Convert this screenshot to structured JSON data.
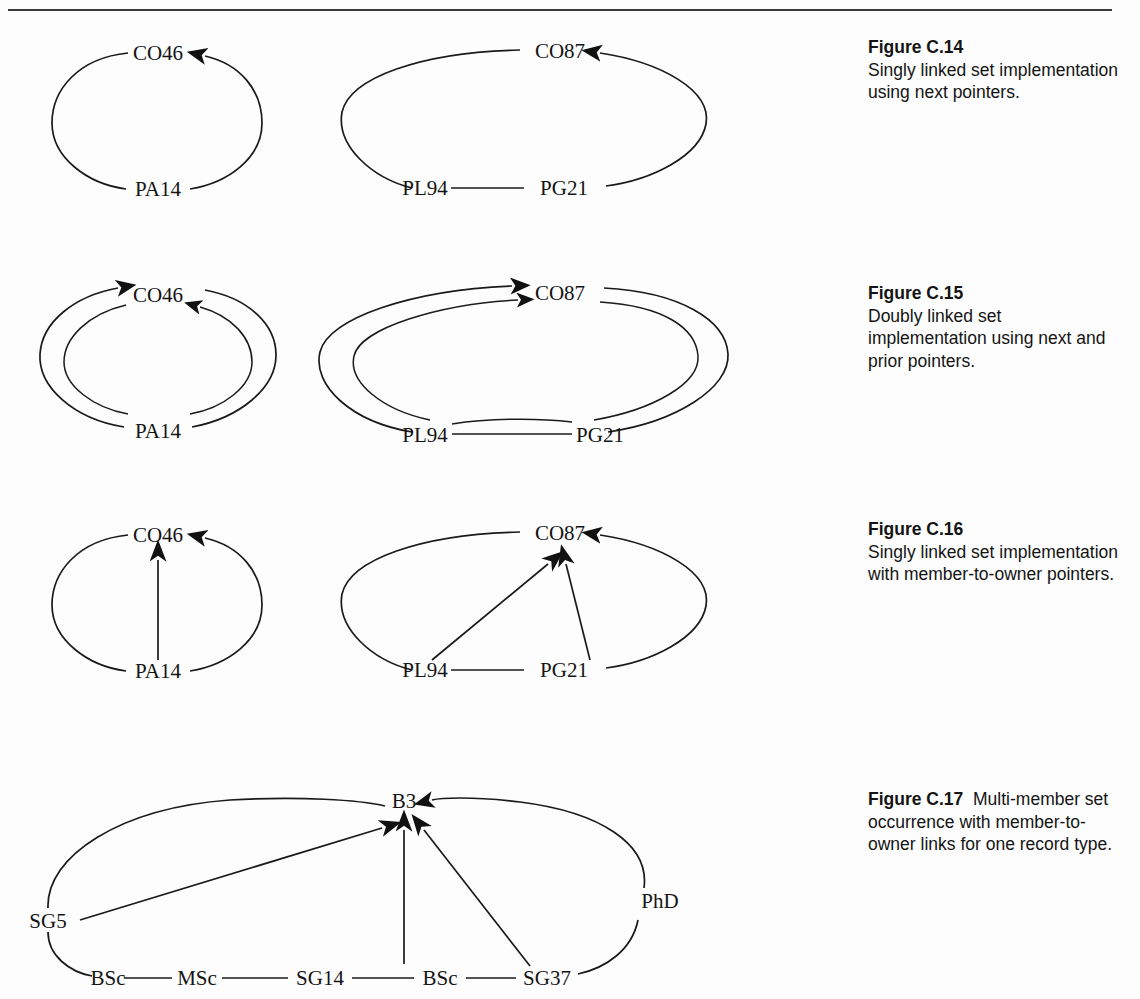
{
  "page": {
    "background": "#fdfdfd",
    "ink": "#141414",
    "rule_color": "#3a3a3a"
  },
  "figures": [
    {
      "id": "c14",
      "caption_lead": "Figure C.14",
      "caption_body": "Singly linked set implementation using next pointers.",
      "diagrams": [
        {
          "id": "c14-left",
          "kind": "singly-linked-ring",
          "owner": "CO46",
          "members": [
            "PA14"
          ],
          "nodes": [
            "CO46",
            "PA14"
          ]
        },
        {
          "id": "c14-right",
          "kind": "singly-linked-ring",
          "owner": "CO87",
          "members": [
            "PL94",
            "PG21"
          ],
          "nodes": [
            "CO87",
            "PL94",
            "PG21"
          ]
        }
      ]
    },
    {
      "id": "c15",
      "caption_lead": "Figure C.15",
      "caption_body": "Doubly linked set implementation using next and prior pointers.",
      "diagrams": [
        {
          "id": "c15-left",
          "kind": "doubly-linked-ring",
          "owner": "CO46",
          "members": [
            "PA14"
          ],
          "nodes": [
            "CO46",
            "PA14"
          ]
        },
        {
          "id": "c15-right",
          "kind": "doubly-linked-ring",
          "owner": "CO87",
          "members": [
            "PL94",
            "PG21"
          ],
          "nodes": [
            "CO87",
            "PL94",
            "PG21"
          ]
        }
      ]
    },
    {
      "id": "c16",
      "caption_lead": "Figure C.16",
      "caption_body": "Singly linked set implementation with member-to-owner pointers.",
      "diagrams": [
        {
          "id": "c16-left",
          "kind": "singly-linked-ring-with-owner-pointers",
          "owner": "CO46",
          "members": [
            "PA14"
          ],
          "nodes": [
            "CO46",
            "PA14"
          ]
        },
        {
          "id": "c16-right",
          "kind": "singly-linked-ring-with-owner-pointers",
          "owner": "CO87",
          "members": [
            "PL94",
            "PG21"
          ],
          "nodes": [
            "CO87",
            "PL94",
            "PG21"
          ]
        }
      ]
    },
    {
      "id": "c17",
      "caption_lead": "Figure C.17",
      "caption_body": "Multi-member set occurrence with member-to-owner links for one record type.",
      "caption_inline": true,
      "diagrams": [
        {
          "id": "c17-main",
          "kind": "multi-member-set-occurrence",
          "owner": "B3",
          "members": [
            "SG5",
            "BSc",
            "MSc",
            "SG14",
            "BSc",
            "SG37",
            "PhD"
          ],
          "owner_pointer_sources": [
            "SG5",
            "SG14",
            "SG37"
          ],
          "nodes": [
            "B3",
            "SG5",
            "BSc",
            "MSc",
            "SG14",
            "BSc",
            "SG37",
            "PhD"
          ]
        }
      ]
    }
  ],
  "labels": {
    "c14_left": {
      "owner": "CO46",
      "m1": "PA14"
    },
    "c14_right": {
      "owner": "CO87",
      "m1": "PL94",
      "m2": "PG21"
    },
    "c15_left": {
      "owner": "CO46",
      "m1": "PA14"
    },
    "c15_right": {
      "owner": "CO87",
      "m1": "PL94",
      "m2": "PG21"
    },
    "c16_left": {
      "owner": "CO46",
      "m1": "PA14"
    },
    "c16_right": {
      "owner": "CO87",
      "m1": "PL94",
      "m2": "PG21"
    },
    "c17": {
      "owner": "B3",
      "n1": "SG5",
      "n2": "BSc",
      "n3": "MSc",
      "n4": "SG14",
      "n5": "BSc",
      "n6": "SG37",
      "n7": "PhD"
    }
  }
}
